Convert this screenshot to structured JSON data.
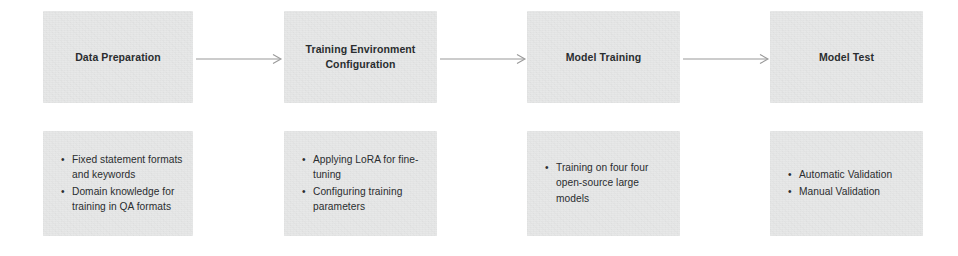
{
  "diagram": {
    "background_color": "#ffffff",
    "box_color": "#e7e8e8",
    "text_color": "#2a2d2f",
    "arrow_color": "#9a9a9a",
    "stages": [
      {
        "title": "Data Preparation",
        "bullets": [
          "Fixed statement formats and keywords",
          "Domain knowledge for training in QA formats"
        ]
      },
      {
        "title": "Training Environment Configuration",
        "bullets": [
          "Applying LoRA for fine-tuning",
          "Configuring training parameters"
        ]
      },
      {
        "title": "Model Training",
        "bullets": [
          "Training on four four open-source large models"
        ]
      },
      {
        "title": "Model Test",
        "bullets": [
          "Automatic Validation",
          "Manual Validation"
        ]
      }
    ],
    "connectors": [
      {
        "from": "Data Preparation",
        "to": "Training Environment Configuration",
        "glyph": "arrow-right"
      },
      {
        "from": "Training Environment Configuration",
        "to": "Model Training",
        "glyph": "arrow-right"
      },
      {
        "from": "Model Training",
        "to": "Model Test",
        "glyph": "arrow-right"
      }
    ],
    "bullet_glyph": "•"
  }
}
